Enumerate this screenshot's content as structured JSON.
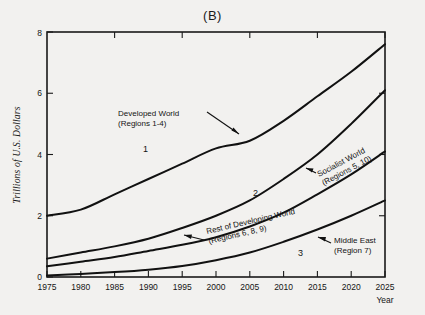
{
  "chart_data": {
    "type": "line",
    "title": "(B)",
    "xlabel": "Year",
    "ylabel": "Trillions of U.S. Dollars",
    "xlim": [
      1975,
      2025
    ],
    "ylim": [
      0,
      8
    ],
    "xticks": [
      1975,
      1980,
      1985,
      1990,
      1995,
      2000,
      2005,
      2010,
      2015,
      2020,
      2025
    ],
    "yticks": [
      0,
      2,
      4,
      6,
      8
    ],
    "grid": false,
    "legend_position": "inline-annotations",
    "x": [
      1975,
      1980,
      1985,
      1990,
      1995,
      2000,
      2005,
      2010,
      2015,
      2020,
      2025
    ],
    "series": [
      {
        "name": "Developed World",
        "curve_number": "1",
        "regions": "(Regions 1-4)",
        "values": [
          2.0,
          2.2,
          2.7,
          3.2,
          3.7,
          4.2,
          4.45,
          5.1,
          5.9,
          6.7,
          7.6
        ]
      },
      {
        "name": "Socialist World",
        "curve_number": "2",
        "regions": "(Regions 5, 10)",
        "values": [
          0.6,
          0.8,
          1.0,
          1.25,
          1.6,
          2.0,
          2.5,
          3.2,
          4.0,
          5.0,
          6.1
        ]
      },
      {
        "name": "Rest of Developing World",
        "curve_number": "",
        "regions": "(Regions 6, 8, 9)",
        "values": [
          0.35,
          0.5,
          0.65,
          0.85,
          1.05,
          1.3,
          1.65,
          2.1,
          2.7,
          3.35,
          4.1
        ]
      },
      {
        "name": "Middle East",
        "curve_number": "3",
        "regions": "(Region 7)",
        "values": [
          0.05,
          0.1,
          0.16,
          0.24,
          0.36,
          0.55,
          0.8,
          1.15,
          1.55,
          2.0,
          2.5
        ]
      }
    ],
    "annotations": [
      {
        "id": "developed-world",
        "line1": "Developed World",
        "line2": "(Regions 1-4)"
      },
      {
        "id": "socialist-world",
        "line1": "Socialist World",
        "line2": "(Regions 5, 10)"
      },
      {
        "id": "rest-developing",
        "line1": "Rest of Developing World",
        "line2": "(Regions 6, 8, 9)"
      },
      {
        "id": "middle-east",
        "line1": "Middle East",
        "line2": "(Region 7)"
      }
    ],
    "curve_labels": [
      "1",
      "2",
      "3"
    ],
    "colors": {
      "background": "#f2f1ef",
      "line": "#111111",
      "axis": "#1a1a1a",
      "text": "#151515"
    }
  },
  "axis": {
    "x_tick_labels": [
      "1975",
      "1980",
      "1985",
      "1990",
      "1995",
      "2000",
      "2005",
      "2010",
      "2015",
      "2020",
      "2025"
    ],
    "y_tick_labels": [
      "0",
      "2",
      "4",
      "6",
      "8"
    ],
    "x_title": "Year",
    "y_title": "Trillions of U.S. Dollars"
  },
  "page": {
    "title": "(B)"
  }
}
